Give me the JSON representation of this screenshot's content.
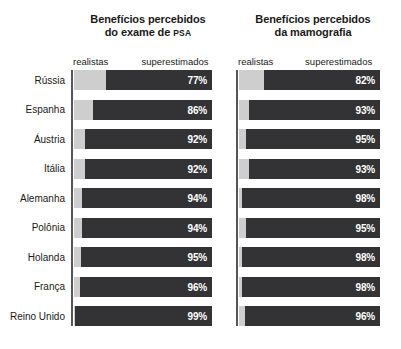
{
  "chart_data": {
    "type": "bar",
    "title": "Benefícios percebidos",
    "orientation": "horizontal",
    "stacked": true,
    "xlim": [
      0,
      100
    ],
    "grid": false,
    "legend_position": "top",
    "categories": [
      "Rússia",
      "Espanha",
      "Áustria",
      "Itália",
      "Alemanha",
      "Polônia",
      "Holanda",
      "França",
      "Reino Unido"
    ],
    "segment_labels": [
      "realistas",
      "superestimados"
    ],
    "colors": {
      "realistas": "#cecece",
      "superestimados": "#333336",
      "value_text": "#ffffff",
      "axis": "#55555a",
      "background": "#ffffff"
    },
    "panels": [
      {
        "title_line1": "Benefícios percebidos",
        "title_line2_prefix": "do exame de ",
        "title_line2_abbr": "PSA",
        "header_left": "realistas",
        "header_right": "superestimados",
        "values": [
          77,
          86,
          92,
          92,
          94,
          94,
          95,
          96,
          99
        ],
        "value_labels": [
          "77%",
          "86%",
          "92%",
          "92%",
          "94%",
          "94%",
          "95%",
          "96%",
          "99%"
        ]
      },
      {
        "title_line1": "Benefícios percebidos",
        "title_line2_prefix": "da mamografia",
        "title_line2_abbr": "",
        "header_left": "realistas",
        "header_right": "superestimados",
        "values": [
          82,
          93,
          95,
          93,
          98,
          95,
          98,
          98,
          96
        ],
        "value_labels": [
          "82%",
          "93%",
          "95%",
          "93%",
          "98%",
          "95%",
          "98%",
          "98%",
          "96%"
        ]
      }
    ]
  }
}
